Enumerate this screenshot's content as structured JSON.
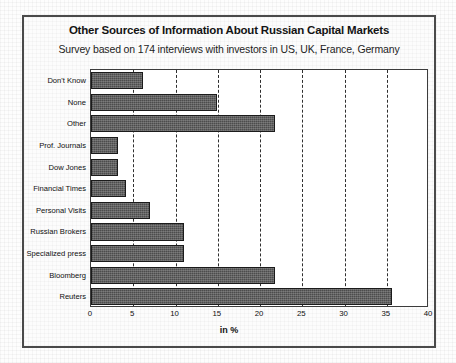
{
  "chart_data": {
    "type": "bar",
    "orientation": "horizontal",
    "title": "Other Sources of Information About Russian Capital Markets",
    "subtitle": "Survey based on 174 interviews with investors in US, UK, France, Germany",
    "xlabel": "in %",
    "ylabel": "",
    "xlim": [
      0,
      40
    ],
    "xticks": [
      0,
      5,
      10,
      15,
      20,
      25,
      30,
      35,
      40
    ],
    "grid": true,
    "legend": "none",
    "categories": [
      "Don't Know",
      "None",
      "Other",
      "Prof. Journals",
      "Dow Jones",
      "Financial Times",
      "Personal Visits",
      "Russian Brokers",
      "Specialized press",
      "Bloomberg",
      "Reuters"
    ],
    "values": [
      6.1,
      14.9,
      21.8,
      3.2,
      3.2,
      4.1,
      7.0,
      11.0,
      11.0,
      21.8,
      35.6
    ],
    "bar_color": "#5a5a5a",
    "bar_border_color": "#1b1b1b",
    "plot_background": "#ffffff",
    "frame_color": "#4a4a4a"
  }
}
